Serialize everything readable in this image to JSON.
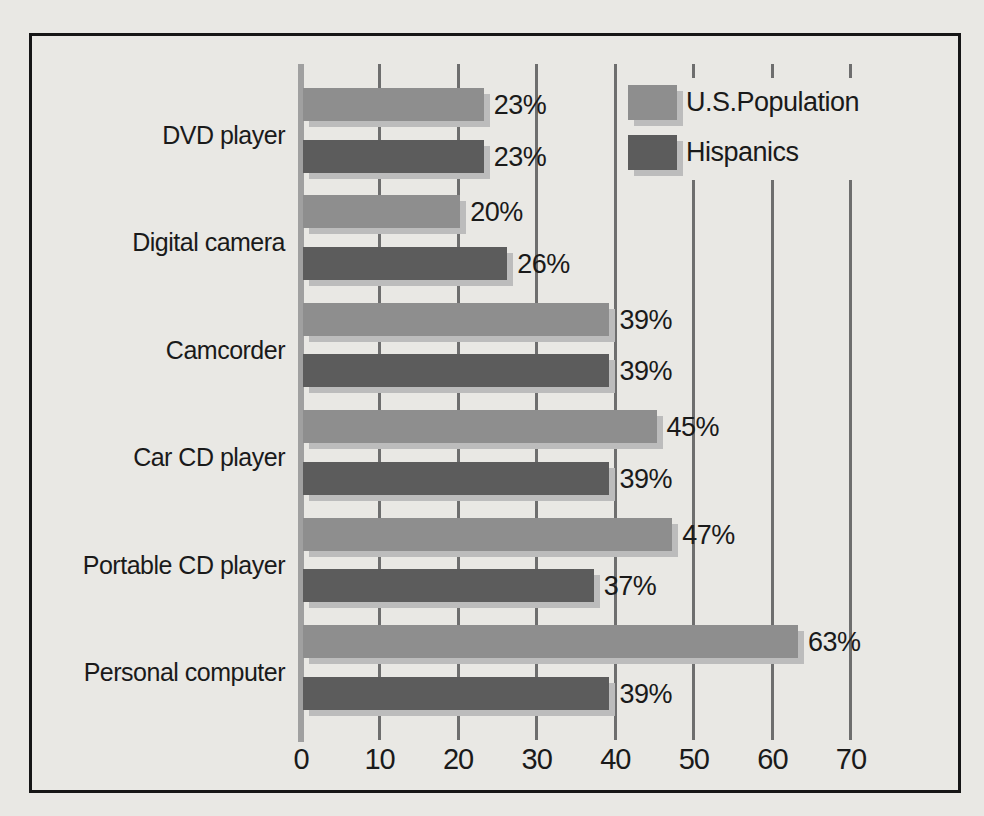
{
  "figure": {
    "background": "#e9e8e4",
    "frame_border_color": "#161616"
  },
  "chart_data": {
    "type": "bar",
    "orientation": "horizontal",
    "title": "",
    "xlabel": "",
    "ylabel": "",
    "categories": [
      "DVD player",
      "Digital camera",
      "Camcorder",
      "Car CD player",
      "Portable CD player",
      "Personal computer"
    ],
    "series": [
      {
        "name": "U.S.Population",
        "values": [
          23,
          20,
          39,
          45,
          47,
          63
        ],
        "labels": [
          "23%",
          "20%",
          "39%",
          "45%",
          "47%",
          "63%"
        ],
        "color": "#8e8e8e"
      },
      {
        "name": "Hispanics",
        "values": [
          23,
          26,
          39,
          39,
          37,
          39
        ],
        "labels": [
          "23%",
          "26%",
          "39%",
          "39%",
          "37%",
          "39%"
        ],
        "color": "#5c5c5c"
      }
    ],
    "xticks": [
      "0",
      "10",
      "20",
      "30",
      "40",
      "50",
      "60",
      "70"
    ],
    "xtick_values": [
      0,
      10,
      20,
      30,
      40,
      50,
      60,
      70
    ],
    "xlim": [
      0,
      70
    ],
    "grid": true,
    "legend_position": "top-right",
    "colors": {
      "gridline": "#6e6e6e",
      "axis": "#a0a0a0",
      "bar_shadow": "#bcbcbc",
      "text": "#1a1a1a"
    }
  }
}
